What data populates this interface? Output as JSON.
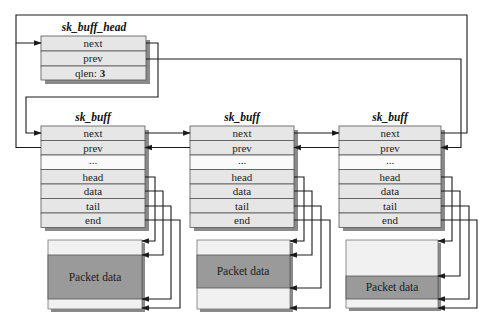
{
  "head": {
    "title": "sk_buff_head",
    "fields": [
      "next",
      "prev",
      "qlen: "
    ],
    "qlen_value": "3"
  },
  "buffers": [
    {
      "title": "sk_buff",
      "fields": [
        "next",
        "prev",
        "...",
        "head",
        "data",
        "tail",
        "end"
      ],
      "packet_label": "Packet data"
    },
    {
      "title": "sk_buff",
      "fields": [
        "next",
        "prev",
        "...",
        "head",
        "data",
        "tail",
        "end"
      ],
      "packet_label": "Packet data"
    },
    {
      "title": "sk_buff",
      "fields": [
        "next",
        "prev",
        "...",
        "head",
        "data",
        "tail",
        "end"
      ],
      "packet_label": "Packet data"
    }
  ],
  "colors": {
    "cell_fill": "#e6e6e6",
    "blank_cell_fill": "#fafafa",
    "packet_fill": "#9a9a9a",
    "packet_light": "#f1f1f1",
    "shadow": "#8a8a8a",
    "line": "#1a1a1a"
  }
}
